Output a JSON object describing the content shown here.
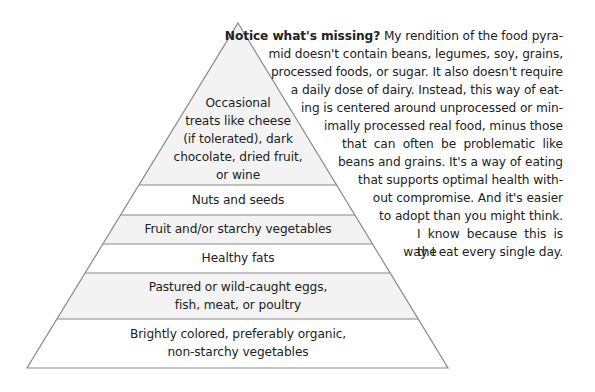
{
  "pyramid": {
    "colors": {
      "outline": "#8a8a8a",
      "band_gray": "#f3f3f3",
      "band_white": "#ffffff"
    },
    "tiers": [
      {
        "label_lines": [
          "Occasional",
          "treats like cheese",
          "(if tolerated), dark",
          "chocolate, dried fruit,",
          "or wine"
        ],
        "fill": "gray"
      },
      {
        "label_lines": [
          "Nuts and seeds"
        ],
        "fill": "white"
      },
      {
        "label_lines": [
          "Fruit and/or starchy vegetables"
        ],
        "fill": "gray"
      },
      {
        "label_lines": [
          "Healthy fats"
        ],
        "fill": "white"
      },
      {
        "label_lines": [
          "Pastured or wild-caught eggs,",
          "fish, meat, or poultry"
        ],
        "fill": "gray"
      },
      {
        "label_lines": [
          "Brightly colored, preferably organic,",
          "non-starchy vegetables"
        ],
        "fill": "white"
      }
    ]
  },
  "paragraph": {
    "lead": "Notice what's missing?",
    "lines": [
      " My rendition of the food pyra-",
      "mid doesn't contain beans, legumes, soy, grains,",
      "processed foods, or sugar. It also doesn't require",
      "a daily dose of dairy. Instead, this way of eat-",
      "ing is centered around unprocessed or min-",
      "imally processed real food, minus those",
      "that can often be problematic like",
      "beans and grains. It's a way of eating",
      "that supports optimal health with-",
      "out compromise. And it's easier",
      "to adopt than you might think.",
      "I know because this is the",
      "way I eat every single day."
    ]
  }
}
